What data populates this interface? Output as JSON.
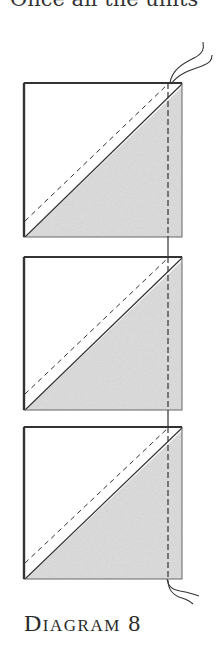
{
  "top_text": "Once all the units",
  "caption": "Diagram 8",
  "colors": {
    "outline": "#333333",
    "shaded_fill": "#cfcfcf",
    "white_fill": "#ffffff",
    "stitch": "#333333",
    "thread": "#333333"
  },
  "units": [
    {
      "name": "unit-1",
      "shaded_half": "bottom-right",
      "stitch_line": "dashed-diagonal"
    },
    {
      "name": "unit-2",
      "shaded_half": "bottom-right",
      "stitch_line": "dashed-diagonal"
    },
    {
      "name": "unit-3",
      "shaded_half": "bottom-right",
      "stitch_line": "dashed-diagonal"
    }
  ],
  "chain_piecing": {
    "thread_tails": [
      "top",
      "bottom"
    ],
    "vertical_stitch": "dashed"
  }
}
